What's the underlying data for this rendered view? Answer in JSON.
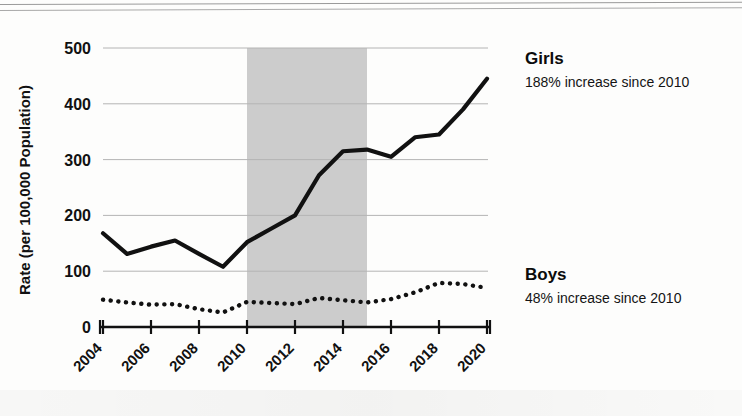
{
  "chart_data": {
    "type": "line",
    "title": "",
    "xlabel": "",
    "ylabel": "Rate (per 100,000 Population)",
    "x": [
      2004,
      2005,
      2006,
      2007,
      2008,
      2009,
      2010,
      2011,
      2012,
      2013,
      2014,
      2015,
      2016,
      2017,
      2018,
      2019,
      2020
    ],
    "xlim": [
      2004,
      2020
    ],
    "ylim": [
      0,
      500
    ],
    "yticks": [
      0,
      100,
      200,
      300,
      400,
      500
    ],
    "xticks": [
      2004,
      2006,
      2008,
      2010,
      2012,
      2014,
      2016,
      2018,
      2020
    ],
    "xtick_labels": [
      "2004",
      "2006",
      "2008",
      "2010",
      "2012",
      "2014",
      "2016",
      "2018",
      "2020"
    ],
    "ytick_labels": [
      "0",
      "100",
      "200",
      "300",
      "400",
      "500"
    ],
    "grid": "horizontal",
    "legend_position": "right-inline",
    "series": [
      {
        "name": "Girls",
        "style": "solid",
        "color": "#111111",
        "annotation": "188% increase since 2010",
        "values": [
          168,
          131,
          144,
          155,
          131,
          108,
          152,
          176,
          200,
          272,
          315,
          318,
          305,
          340,
          345,
          390,
          445
        ]
      },
      {
        "name": "Boys",
        "style": "dotted",
        "color": "#111111",
        "annotation": "48% increase since 2010",
        "values": [
          49,
          44,
          40,
          41,
          32,
          26,
          45,
          43,
          41,
          52,
          48,
          44,
          50,
          62,
          79,
          77,
          70
        ]
      }
    ],
    "shaded_region": {
      "label": "",
      "x_start": 2010,
      "x_end": 2015,
      "color": "#c9c9c9"
    }
  },
  "legend": {
    "girls_title": "Girls",
    "girls_note": "188% increase since 2010",
    "boys_title": "Boys",
    "boys_note": "48% increase since 2010"
  },
  "axes": {
    "y_axis_title": "Rate (per 100,000 Population)"
  }
}
